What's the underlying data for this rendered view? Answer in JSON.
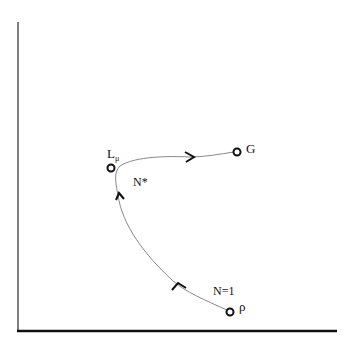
{
  "diagram": {
    "points": {
      "rho": {
        "label": "ρ"
      },
      "L_mu": {
        "label": "L",
        "subscript": "μ"
      },
      "G": {
        "label": "G"
      }
    },
    "annotations": {
      "n_star": "N*",
      "n_one": "N=1"
    },
    "flow_direction": "rho → L_mu → G",
    "colors": {
      "axis": "#111111",
      "curve": "#888888",
      "arrow": "#111111",
      "marker": "#111111"
    }
  }
}
